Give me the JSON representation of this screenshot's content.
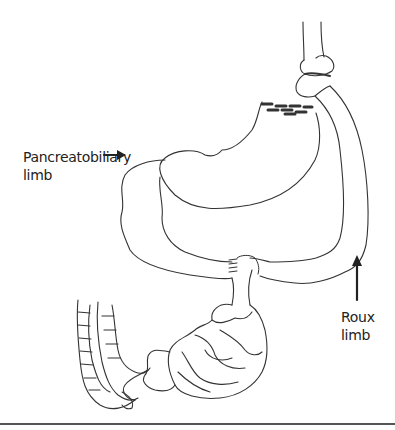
{
  "figure": {
    "labels": {
      "pancreatobiliary_line1": "Pancreatobiliary",
      "pancreatobiliary_line2": "limb",
      "roux_line1": "Roux",
      "roux_line2": "limb"
    },
    "structures": [
      "esophagus",
      "gastric-pouch",
      "staple-line",
      "bypassed-stomach",
      "pancreatobiliary-limb",
      "roux-limb",
      "jejunojejunostomy",
      "small-intestine",
      "colon"
    ],
    "colors": {
      "line": "#333333",
      "arrow": "#222222",
      "staple": "#333333",
      "rule": "#555555"
    }
  }
}
